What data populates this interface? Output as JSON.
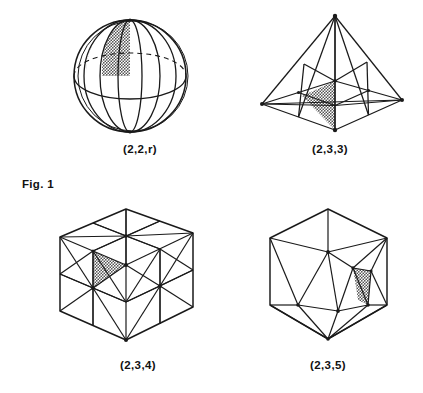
{
  "figure": {
    "label": "Fig. 1",
    "panels": [
      {
        "id": "sphere",
        "caption": "(2,2,r)",
        "shape_name": "dihedral-sphere",
        "description": "sphere divided by meridians and an equator, one spherical triangle shaded"
      },
      {
        "id": "tetrahedron",
        "caption": "(2,3,3)",
        "shape_name": "tetrahedron",
        "description": "tetrahedron with barycentric subdivision, one triangle shaded"
      },
      {
        "id": "cube",
        "caption": "(2,3,4)",
        "shape_name": "cube",
        "description": "cube with barycentric subdivision of each face, one triangle shaded"
      },
      {
        "id": "icosahedron",
        "caption": "(2,3,5)",
        "shape_name": "icosahedron",
        "description": "icosahedron with subdivided faces, one triangle shaded"
      }
    ]
  },
  "style": {
    "line_color": "#1a1a1a",
    "shade_color": "#a8a8a8",
    "background": "#ffffff"
  }
}
